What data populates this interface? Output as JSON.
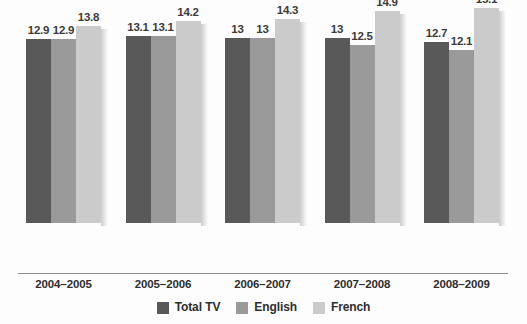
{
  "chart_data": {
    "type": "bar",
    "title": "",
    "subtitle": "",
    "xlabel": "",
    "ylabel": "",
    "grid": false,
    "legend_position": "bottom-center",
    "ylim": [
      0,
      16.2
    ],
    "axis_baseline_value": 0,
    "categories": [
      "2004–2005",
      "2005–2006",
      "2006–2007",
      "2007–2008",
      "2008–2009"
    ],
    "series": [
      {
        "name": "Total TV",
        "color": "#595959",
        "values": [
          12.9,
          13.1,
          13,
          13,
          12.7
        ],
        "labels": [
          "12.9",
          "13.1",
          "13",
          "13",
          "12.7"
        ]
      },
      {
        "name": "English",
        "color": "#9a9a9a",
        "values": [
          12.9,
          13.1,
          13,
          12.5,
          12.1
        ],
        "labels": [
          "12.9",
          "13.1",
          "13",
          "12.5",
          "12.1"
        ]
      },
      {
        "name": "French",
        "color": "#cbcbcb",
        "values": [
          13.8,
          14.2,
          14.3,
          14.9,
          15.1
        ],
        "labels": [
          "13.8",
          "14.2",
          "14.3",
          "14.9",
          "15.1"
        ]
      }
    ]
  },
  "legend": {
    "items": [
      {
        "label": "Total TV",
        "swatch": "dark-gray-swatch"
      },
      {
        "label": "English",
        "swatch": "medium-gray-swatch"
      },
      {
        "label": "French",
        "swatch": "light-gray-swatch"
      }
    ]
  },
  "colors": {
    "series_total_tv": "#595959",
    "series_english": "#9a9a9a",
    "series_french": "#cbcbcb",
    "axis": "#8d8d8d",
    "text": "#2e2e2e",
    "background": "#fdfdfd"
  }
}
